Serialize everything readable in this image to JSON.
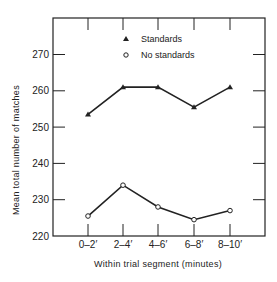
{
  "chart_data": {
    "type": "line",
    "title": "",
    "xlabel": "Within trial segment (minutes)",
    "ylabel": "Mean total number of matches",
    "categories": [
      "0–2′",
      "2–4′",
      "4–6′",
      "6–8′",
      "8–10′"
    ],
    "yticks": [
      220,
      230,
      240,
      250,
      260,
      270
    ],
    "ylim": [
      220,
      279
    ],
    "grid": false,
    "legend_position": "top-center inside",
    "series": [
      {
        "name": "Standards",
        "marker": "filled-triangle",
        "values": [
          253.5,
          261,
          261,
          255.5,
          261
        ]
      },
      {
        "name": "No standards",
        "marker": "open-circle",
        "values": [
          225.5,
          234,
          228,
          224.5,
          227
        ]
      }
    ]
  },
  "legend": {
    "items": [
      {
        "label": "Standards",
        "marker": "filled-triangle"
      },
      {
        "label": "No standards",
        "marker": "open-circle"
      }
    ]
  }
}
